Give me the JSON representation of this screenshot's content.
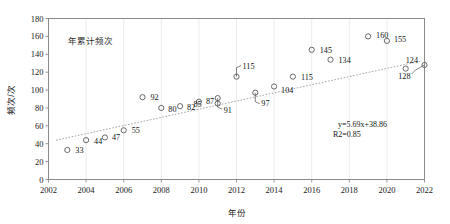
{
  "chart_data": {
    "type": "scatter",
    "title": "",
    "legend": "年累计频次",
    "legend_position": "top-left-inside",
    "xlabel": "年份",
    "ylabel": "频次/次",
    "xlim": [
      2002,
      2022
    ],
    "ylim": [
      0,
      180
    ],
    "xticks": [
      "2002",
      "2004",
      "2006",
      "2008",
      "2010",
      "2012",
      "2014",
      "2016",
      "2018",
      "2020",
      "2022"
    ],
    "yticks": [
      "0",
      "20",
      "40",
      "60",
      "80",
      "100",
      "120",
      "140",
      "160",
      "180"
    ],
    "grid": "vertical-only",
    "trendline": {
      "equation": "y=5.69x+38.86",
      "r2": "R2=0.85",
      "slope": 5.69,
      "intercept": 38.86,
      "style": "dotted"
    },
    "points": [
      {
        "x": 2003,
        "y": 33,
        "label": "33",
        "label_dx": 8,
        "label_dy": 3.5,
        "leader": false
      },
      {
        "x": 2004,
        "y": 44,
        "label": "44",
        "label_dx": 8,
        "label_dy": 3.5,
        "leader": false
      },
      {
        "x": 2005,
        "y": 47,
        "label": "47",
        "label_dx": 7,
        "label_dy": 3.0,
        "leader": false
      },
      {
        "x": 2006,
        "y": 55,
        "label": "55",
        "label_dx": 8,
        "label_dy": 3.0,
        "leader": false
      },
      {
        "x": 2007,
        "y": 92,
        "label": "92",
        "label_dx": 8,
        "label_dy": 3.0,
        "leader": false
      },
      {
        "x": 2008,
        "y": 80,
        "label": "80",
        "label_dx": 7,
        "label_dy": 4.0,
        "leader": false
      },
      {
        "x": 2009,
        "y": 82,
        "label": "82",
        "label_dx": 7,
        "label_dy": 3.5,
        "leader": false
      },
      {
        "x": 2010,
        "y": 87,
        "label": "87",
        "label_dx": 7,
        "label_dy": 2.5,
        "leader": false
      },
      {
        "x": 2011,
        "y": 85,
        "label": "85",
        "label_dx": -16,
        "label_dy": 3.5,
        "leader": false
      },
      {
        "x": 2011,
        "y": 91,
        "label": "91",
        "label_dx": 6,
        "label_dy": 15,
        "leader": true,
        "leader_path": "down-right"
      },
      {
        "x": 2012,
        "y": 115,
        "label": "115",
        "label_dx": 6,
        "label_dy": -8,
        "leader": true,
        "leader_path": "up-right"
      },
      {
        "x": 2013,
        "y": 97,
        "label": "97",
        "label_dx": 6,
        "label_dy": 13,
        "leader": true,
        "leader_path": "down-right"
      },
      {
        "x": 2014,
        "y": 104,
        "label": "104",
        "label_dx": 7,
        "label_dy": 6.5,
        "leader": false
      },
      {
        "x": 2015,
        "y": 115,
        "label": "115",
        "label_dx": 8,
        "label_dy": 3.5,
        "leader": false
      },
      {
        "x": 2016,
        "y": 145,
        "label": "145",
        "label_dx": 8,
        "label_dy": 3.0,
        "leader": false
      },
      {
        "x": 2017,
        "y": 134,
        "label": "134",
        "label_dx": 8,
        "label_dy": 3.5,
        "leader": false
      },
      {
        "x": 2019,
        "y": 160,
        "label": "160",
        "label_dx": 8,
        "label_dy": 2.0,
        "leader": false
      },
      {
        "x": 2020,
        "y": 155,
        "label": "155",
        "label_dx": 7,
        "label_dy": 1.0,
        "leader": false
      },
      {
        "x": 2021,
        "y": 124,
        "label": "124",
        "label_dx": 0,
        "label_dy": -6,
        "leader": false
      },
      {
        "x": 2022,
        "y": 128,
        "label": "128",
        "label_dx": -14,
        "label_dy": 14,
        "leader": true,
        "leader_path": "down-left"
      }
    ]
  }
}
